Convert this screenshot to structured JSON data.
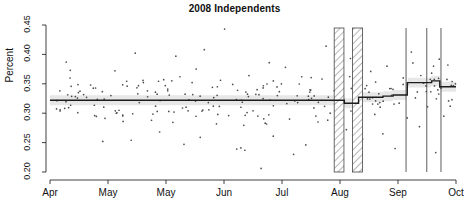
{
  "chart_data": {
    "type": "scatter",
    "title": "2008 Independents",
    "xlabel": "",
    "ylabel": "Percent",
    "ylim": [
      0.2,
      0.45
    ],
    "yticks": [
      "0.20",
      "0.25",
      "0.30",
      "0.35",
      "0.40",
      "0.45"
    ],
    "ytick_values": [
      0.2,
      0.25,
      0.3,
      0.35,
      0.4,
      0.45
    ],
    "xticks": [
      "Apr",
      "May",
      "May",
      "Jun",
      "Jul",
      "Aug",
      "Sep",
      "Oct"
    ],
    "xtick_positions": [
      0,
      1,
      2,
      3,
      4,
      5,
      6,
      7
    ],
    "grid": false,
    "legend": null,
    "series": [
      {
        "name": "daily poll observations",
        "type": "scatter",
        "marker": "small dot",
        "color": "#3a3a3a",
        "points": [
          [
            0.04,
            0.387
          ],
          [
            0.05,
            0.373
          ],
          [
            0.07,
            0.335
          ],
          [
            0.09,
            0.327
          ],
          [
            0.1,
            0.348
          ],
          [
            0.11,
            0.296
          ],
          [
            0.13,
            0.252
          ],
          [
            0.15,
            0.33
          ],
          [
            0.16,
            0.372
          ],
          [
            0.17,
            0.305
          ],
          [
            0.18,
            0.286
          ],
          [
            0.19,
            0.346
          ],
          [
            0.2,
            0.254
          ],
          [
            0.21,
            0.402
          ],
          [
            0.22,
            0.318
          ],
          [
            0.23,
            0.352
          ],
          [
            0.24,
            0.338
          ],
          [
            0.25,
            0.288
          ],
          [
            0.26,
            0.312
          ],
          [
            0.27,
            0.268
          ],
          [
            0.28,
            0.357
          ],
          [
            0.29,
            0.341
          ],
          [
            0.3,
            0.355
          ],
          [
            0.31,
            0.397
          ],
          [
            0.32,
            0.362
          ],
          [
            0.33,
            0.247
          ],
          [
            0.34,
            0.304
          ],
          [
            0.35,
            0.352
          ],
          [
            0.36,
            0.375
          ],
          [
            0.37,
            0.259
          ],
          [
            0.38,
            0.408
          ],
          [
            0.39,
            0.318
          ],
          [
            0.4,
            0.344
          ],
          [
            0.41,
            0.282
          ],
          [
            0.42,
            0.356
          ],
          [
            0.43,
            0.443
          ],
          [
            0.44,
            0.296
          ],
          [
            0.45,
            0.349
          ],
          [
            0.46,
            0.239
          ],
          [
            0.47,
            0.241
          ],
          [
            0.48,
            0.237
          ],
          [
            0.49,
            0.364
          ],
          [
            0.5,
            0.304
          ],
          [
            0.51,
            0.34
          ],
          [
            0.52,
            0.206
          ],
          [
            0.53,
            0.283
          ],
          [
            0.54,
            0.386
          ],
          [
            0.55,
            0.261
          ],
          [
            0.56,
            0.33
          ],
          [
            0.57,
            0.35
          ],
          [
            0.58,
            0.378
          ],
          [
            0.59,
            0.29
          ],
          [
            0.6,
            0.23
          ],
          [
            0.61,
            0.318
          ],
          [
            0.62,
            0.362
          ],
          [
            0.63,
            0.246
          ],
          [
            0.64,
            0.336
          ],
          [
            0.65,
            0.309
          ],
          [
            0.66,
            0.285
          ],
          [
            0.67,
            0.358
          ],
          [
            0.68,
            0.414
          ],
          [
            0.69,
            0.3
          ],
          [
            0.7,
            0.338
          ],
          [
            0.71,
            0.213
          ],
          [
            0.72,
            0.354
          ],
          [
            0.73,
            0.272
          ],
          [
            0.74,
            0.393
          ],
          [
            0.75,
            0.305
          ],
          [
            0.76,
            0.329
          ],
          [
            0.77,
            0.256
          ],
          [
            0.78,
            0.347
          ],
          [
            0.79,
            0.371
          ],
          [
            0.8,
            0.298
          ],
          [
            0.81,
            0.333
          ],
          [
            0.82,
            0.265
          ],
          [
            0.83,
            0.38
          ],
          [
            0.84,
            0.342
          ],
          [
            0.85,
            0.24
          ],
          [
            0.86,
            0.317
          ],
          [
            0.87,
            0.36
          ],
          [
            0.88,
            0.292
          ],
          [
            0.89,
            0.404
          ],
          [
            0.9,
            0.326
          ],
          [
            0.91,
            0.277
          ],
          [
            0.92,
            0.351
          ],
          [
            0.93,
            0.311
          ],
          [
            0.94,
            0.368
          ],
          [
            0.95,
            0.233
          ],
          [
            0.96,
            0.345
          ],
          [
            0.97,
            0.295
          ],
          [
            0.98,
            0.382
          ],
          [
            0.99,
            0.323
          ]
        ],
        "n_points": 250,
        "note": "point x expressed as fraction of Apr-to-Oct axis span"
      },
      {
        "name": "smoothed step trend",
        "type": "line",
        "color": "#1c1c1c",
        "linewidth": 1.4,
        "steps": [
          {
            "from": 0.0,
            "to": 0.725,
            "value": 0.322
          },
          {
            "from": 0.725,
            "to": 0.76,
            "value": 0.317
          },
          {
            "from": 0.76,
            "to": 0.82,
            "value": 0.327
          },
          {
            "from": 0.82,
            "to": 0.845,
            "value": 0.329
          },
          {
            "from": 0.845,
            "to": 0.88,
            "value": 0.331
          },
          {
            "from": 0.88,
            "to": 0.94,
            "value": 0.352
          },
          {
            "from": 0.94,
            "to": 0.96,
            "value": 0.355
          },
          {
            "from": 0.96,
            "to": 1.0,
            "value": 0.345
          }
        ]
      },
      {
        "name": "confidence ribbon",
        "type": "area",
        "color": "#e3e3e3",
        "half_width": 0.0085
      }
    ],
    "annotations": [
      {
        "kind": "hatched-band",
        "name": "dnc-convention-band",
        "x_start": 0.7,
        "x_end": 0.724,
        "fill": "diagonal-hatch",
        "stroke": "#444444"
      },
      {
        "kind": "hatched-band",
        "name": "rnc-convention-band",
        "x_start": 0.745,
        "x_end": 0.77,
        "fill": "diagonal-hatch",
        "stroke": "#444444"
      },
      {
        "kind": "vline",
        "name": "debate-line-1",
        "x": 0.877,
        "stroke": "#333333"
      },
      {
        "kind": "vline",
        "name": "debate-line-2",
        "x": 0.928,
        "stroke": "#333333"
      },
      {
        "kind": "vline",
        "name": "debate-line-3",
        "x": 0.963,
        "stroke": "#333333"
      }
    ]
  }
}
